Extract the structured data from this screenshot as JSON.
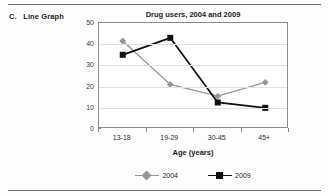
{
  "figure": {
    "label": "C.   Line Graph"
  },
  "chart_data": {
    "type": "line",
    "title": "Drug users, 2004 and 2009",
    "xlabel": "Age (years)",
    "ylabel": "",
    "categories": [
      "13-18",
      "19-29",
      "30-45",
      "45+"
    ],
    "ylim": [
      0,
      50
    ],
    "ytick_labels": [
      "0",
      "10",
      "20",
      "30",
      "40",
      "50"
    ],
    "ytick_values": [
      0,
      10,
      20,
      30,
      40,
      50
    ],
    "grid": true,
    "legend_position": "bottom",
    "series": [
      {
        "name": "2004",
        "values": [
          41.5,
          21,
          15.5,
          22
        ],
        "color": "#969696",
        "marker": "diamond"
      },
      {
        "name": "2009",
        "values": [
          35,
          43,
          12.5,
          10
        ],
        "color": "#111111",
        "marker": "square"
      }
    ]
  }
}
